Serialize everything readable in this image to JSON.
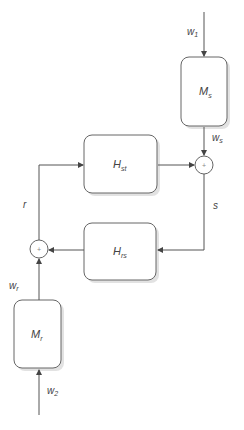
{
  "diagram": {
    "blocks": {
      "Ms": {
        "main": "M",
        "sub": "s"
      },
      "Mr": {
        "main": "M",
        "sub": "r"
      },
      "Hst": {
        "main": "H",
        "sub": "st"
      },
      "Hrs": {
        "main": "H",
        "sub": "rs"
      }
    },
    "signals": {
      "w1": {
        "main": "w",
        "sub": "1"
      },
      "ws": {
        "main": "w",
        "sub": "s"
      },
      "wr": {
        "main": "w",
        "sub": "r"
      },
      "w2": {
        "main": "w",
        "sub": "2"
      },
      "s": "s",
      "r": "r"
    },
    "junctions": {
      "sum_s": "+",
      "sum_r": "+"
    },
    "colors": {
      "stroke": "#555555",
      "shadow": "#d8d8d8",
      "text": "#444444"
    }
  }
}
